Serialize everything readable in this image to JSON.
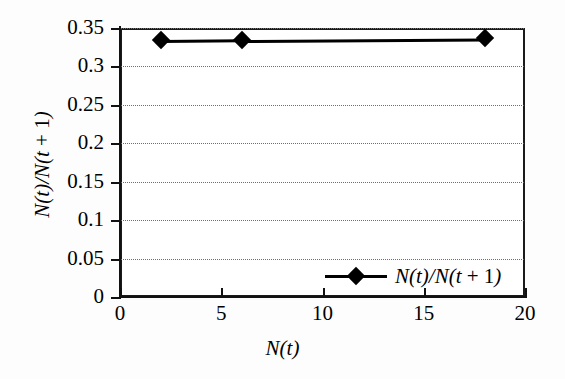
{
  "chart_data": {
    "type": "line",
    "title": "",
    "subtitle": "",
    "xlabel": "N(t)",
    "ylabel": "N(t)/N(t + 1)",
    "xlim": [
      0,
      20
    ],
    "ylim": [
      0,
      0.35
    ],
    "grid": "horizontal-dotted",
    "legend_position": "inside-bottom-right",
    "x_ticks": [
      "0",
      "5",
      "10",
      "15",
      "20"
    ],
    "x_tick_values": [
      0,
      5,
      10,
      15,
      20
    ],
    "y_ticks": [
      "0",
      "0.05",
      "0.1",
      "0.15",
      "0.2",
      "0.25",
      "0.3",
      "0.35"
    ],
    "y_tick_values": [
      0,
      0.05,
      0.1,
      0.15,
      0.2,
      0.25,
      0.3,
      0.35
    ],
    "series": [
      {
        "name": "N(t)/N(t + 1)",
        "marker": "diamond",
        "color": "#000000",
        "x": [
          2,
          6,
          18
        ],
        "values": [
          0.334,
          0.335,
          0.337
        ]
      }
    ],
    "annotations": []
  },
  "legend": {
    "entries": [
      {
        "label_prefix": "N",
        "label": "N(t)/N(t + 1)",
        "marker": "diamond-marker"
      }
    ]
  },
  "axes": {
    "x_title": "N(t)",
    "y_title": "N(t)/N(t + 1)"
  },
  "colors": {
    "series": "#000000",
    "axis": "#111111",
    "gridline": "#6e6e6e",
    "background": "#ffffff"
  }
}
